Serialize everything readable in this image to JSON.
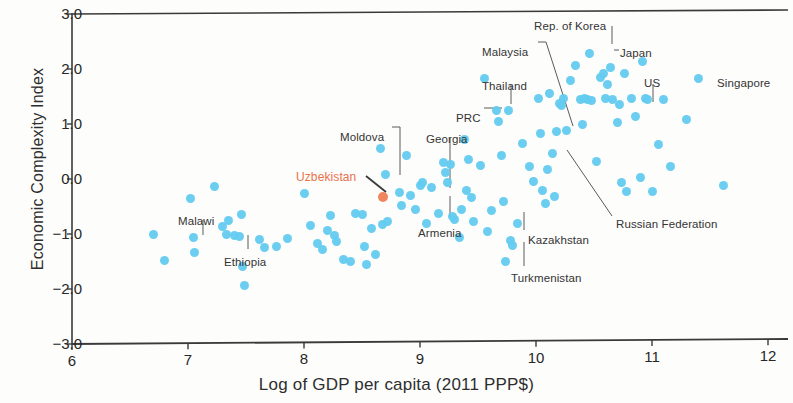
{
  "chart_data": {
    "type": "scatter",
    "title": "",
    "xlabel": "Log of GDP per capita (2011 PPP$)",
    "ylabel": "Economic Complexity Index",
    "xlim": [
      6,
      12
    ],
    "ylim": [
      -3.0,
      3.0
    ],
    "xticks": [
      "6",
      "7",
      "8",
      "9",
      "10",
      "11",
      "12"
    ],
    "yticks": [
      "3.0",
      "2.0",
      "1.0",
      "0.0",
      "-1.0",
      "-2.0",
      "-3.0"
    ],
    "grid": false,
    "legend": "none",
    "colors": {
      "point": "#63cbef",
      "highlight": "#ef8055",
      "axis": "#3a3a3a",
      "text": "#2e2e2e"
    },
    "series": [
      {
        "name": "Countries",
        "color": "#63cbef",
        "points": [
          [
            6.7,
            -1.0
          ],
          [
            6.8,
            -1.49
          ],
          [
            7.02,
            -0.35
          ],
          [
            7.05,
            -1.07
          ],
          [
            7.06,
            -1.33
          ],
          [
            7.23,
            -0.13
          ],
          [
            7.3,
            -0.87
          ],
          [
            7.33,
            -1.0
          ],
          [
            7.35,
            -0.75
          ],
          [
            7.4,
            -1.03
          ],
          [
            7.44,
            -1.05
          ],
          [
            7.46,
            -0.64
          ],
          [
            7.47,
            -1.59
          ],
          [
            7.49,
            -1.93
          ],
          [
            7.62,
            -1.1
          ],
          [
            7.66,
            -1.25
          ],
          [
            7.76,
            -1.22
          ],
          [
            7.86,
            -1.08
          ],
          [
            8.0,
            -0.27
          ],
          [
            8.06,
            -0.85
          ],
          [
            8.12,
            -1.17
          ],
          [
            8.16,
            -1.28
          ],
          [
            8.2,
            -0.93
          ],
          [
            8.23,
            -0.66
          ],
          [
            8.26,
            -1.03
          ],
          [
            8.28,
            -1.13
          ],
          [
            8.34,
            -1.46
          ],
          [
            8.4,
            -1.5
          ],
          [
            8.44,
            -0.63
          ],
          [
            8.5,
            -0.65
          ],
          [
            8.52,
            -1.22
          ],
          [
            8.54,
            -1.55
          ],
          [
            8.58,
            -0.9
          ],
          [
            8.62,
            -1.38
          ],
          [
            8.68,
            -0.82
          ],
          [
            8.72,
            -0.78
          ],
          [
            8.7,
            0.08
          ],
          [
            8.66,
            0.56
          ],
          [
            8.82,
            -0.25
          ],
          [
            8.84,
            -0.48
          ],
          [
            8.88,
            0.43
          ],
          [
            8.92,
            -0.3
          ],
          [
            8.96,
            -0.56
          ],
          [
            9.0,
            -0.12
          ],
          [
            9.02,
            -0.06
          ],
          [
            9.06,
            -0.8
          ],
          [
            9.1,
            -0.16
          ],
          [
            9.16,
            -0.63
          ],
          [
            9.2,
            0.3
          ],
          [
            9.22,
            0.12
          ],
          [
            9.24,
            -0.07
          ],
          [
            9.26,
            0.26
          ],
          [
            9.28,
            -0.68
          ],
          [
            9.3,
            -0.73
          ],
          [
            9.34,
            -1.07
          ],
          [
            9.36,
            -0.55
          ],
          [
            9.38,
            0.72
          ],
          [
            9.4,
            -0.2
          ],
          [
            9.42,
            0.36
          ],
          [
            9.44,
            -0.34
          ],
          [
            9.46,
            -0.77
          ],
          [
            9.52,
            0.25
          ],
          [
            9.56,
            1.82
          ],
          [
            9.58,
            -0.95
          ],
          [
            9.62,
            -0.58
          ],
          [
            9.66,
            1.24
          ],
          [
            9.68,
            1.04
          ],
          [
            9.7,
            0.42
          ],
          [
            9.72,
            -0.4
          ],
          [
            9.74,
            -1.5
          ],
          [
            9.76,
            1.25
          ],
          [
            9.78,
            -1.12
          ],
          [
            9.8,
            -1.2
          ],
          [
            9.84,
            -0.8
          ],
          [
            9.88,
            0.64
          ],
          [
            9.94,
            0.22
          ],
          [
            9.98,
            -0.05
          ],
          [
            10.02,
            1.46
          ],
          [
            10.04,
            0.82
          ],
          [
            10.06,
            -0.2
          ],
          [
            10.08,
            -0.45
          ],
          [
            10.1,
            0.18
          ],
          [
            10.12,
            1.55
          ],
          [
            10.14,
            0.46
          ],
          [
            10.16,
            -0.32
          ],
          [
            10.18,
            0.86
          ],
          [
            10.2,
            1.38
          ],
          [
            10.22,
            1.34
          ],
          [
            10.24,
            1.46
          ],
          [
            10.26,
            0.88
          ],
          [
            10.3,
            1.8
          ],
          [
            10.34,
            2.06
          ],
          [
            10.38,
            1.44
          ],
          [
            10.4,
            1.0
          ],
          [
            10.42,
            1.46
          ],
          [
            10.44,
            1.44
          ],
          [
            10.46,
            2.28
          ],
          [
            10.48,
            1.42
          ],
          [
            10.52,
            0.32
          ],
          [
            10.56,
            1.84
          ],
          [
            10.58,
            1.92
          ],
          [
            10.6,
            1.46
          ],
          [
            10.62,
            1.72
          ],
          [
            10.64,
            2.02
          ],
          [
            10.66,
            1.44
          ],
          [
            10.7,
            1.02
          ],
          [
            10.72,
            1.36
          ],
          [
            10.74,
            -0.06
          ],
          [
            10.76,
            1.92
          ],
          [
            10.78,
            -0.22
          ],
          [
            10.82,
            1.46
          ],
          [
            10.86,
            1.14
          ],
          [
            10.9,
            0.02
          ],
          [
            10.92,
            2.14
          ],
          [
            10.94,
            1.46
          ],
          [
            10.96,
            1.44
          ],
          [
            11.0,
            -0.22
          ],
          [
            11.06,
            0.62
          ],
          [
            11.1,
            1.44
          ],
          [
            11.16,
            0.22
          ],
          [
            11.3,
            1.08
          ],
          [
            11.4,
            1.82
          ],
          [
            11.62,
            -0.12
          ]
        ]
      },
      {
        "name": "Uzbekistan",
        "color": "#ef8055",
        "highlight": true,
        "points": [
          [
            8.68,
            -0.33
          ]
        ]
      }
    ],
    "annotations": [
      {
        "label": "Malawi",
        "text_x": 178,
        "text_y": 215,
        "anchor": "middle",
        "line": [
          [
            203,
            220
          ],
          [
            203,
            235
          ]
        ],
        "highlight": false
      },
      {
        "label": "Ethiopia",
        "text_x": 224,
        "text_y": 256,
        "anchor": "middle",
        "line": [
          [
            248,
            235
          ],
          [
            248,
            249
          ]
        ],
        "highlight": false
      },
      {
        "label": "Moldova",
        "text_x": 340,
        "text_y": 131,
        "anchor": "start",
        "line": [
          [
            392,
            127
          ],
          [
            400,
            127
          ],
          [
            400,
            175
          ]
        ],
        "highlight": false
      },
      {
        "label": "Uzbekistan",
        "text_x": 296,
        "text_y": 170,
        "anchor": "start",
        "line": [
          [
            366,
            176
          ],
          [
            386,
            192
          ]
        ],
        "highlight": true
      },
      {
        "label": "Georgia",
        "text_x": 426,
        "text_y": 133,
        "anchor": "start",
        "line": [
          [
            450,
            138
          ],
          [
            450,
            188
          ]
        ],
        "highlight": false
      },
      {
        "label": "Armenia",
        "text_x": 418,
        "text_y": 227,
        "anchor": "start",
        "line": [
          [
            450,
            196
          ],
          [
            450,
            217
          ]
        ],
        "highlight": false
      },
      {
        "label": "PRC",
        "text_x": 456,
        "text_y": 112,
        "anchor": "start",
        "line": [
          [
            484,
            108
          ],
          [
            502,
            108
          ]
        ],
        "highlight": false
      },
      {
        "label": "Thailand",
        "text_x": 482,
        "text_y": 80,
        "anchor": "start",
        "line": [
          [
            511,
            85
          ],
          [
            511,
            104
          ]
        ],
        "highlight": false
      },
      {
        "label": "Malaysia",
        "text_x": 482,
        "text_y": 46,
        "anchor": "start",
        "line": [
          [
            538,
            42
          ],
          [
            546,
            42
          ],
          [
            573,
            126
          ]
        ],
        "highlight": false
      },
      {
        "label": "Rep. of Korea",
        "text_x": 534,
        "text_y": 20,
        "anchor": "start",
        "line": [
          [
            612,
            26
          ],
          [
            612,
            44
          ]
        ],
        "highlight": false
      },
      {
        "label": "Japan",
        "text_x": 620,
        "text_y": 47,
        "anchor": "start",
        "line": [
          [
            614,
            50
          ],
          [
            619,
            50
          ]
        ],
        "highlight": false
      },
      {
        "label": "US",
        "text_x": 644,
        "text_y": 77,
        "anchor": "start",
        "line": [
          [
            653,
            84
          ],
          [
            653,
            102
          ]
        ],
        "highlight": false
      },
      {
        "label": "Singapore",
        "text_x": 717,
        "text_y": 77,
        "anchor": "start",
        "line": [],
        "highlight": false
      },
      {
        "label": "Kazakhstan",
        "text_x": 528,
        "text_y": 234,
        "anchor": "start",
        "line": [
          [
            524,
            212
          ],
          [
            524,
            230
          ]
        ],
        "highlight": false
      },
      {
        "label": "Turkmenistan",
        "text_x": 511,
        "text_y": 272,
        "anchor": "start",
        "line": [
          [
            524,
            242
          ],
          [
            524,
            266
          ]
        ],
        "highlight": false
      },
      {
        "label": "Russian Federation",
        "text_x": 616,
        "text_y": 218,
        "anchor": "start",
        "line": [
          [
            567,
            150
          ],
          [
            612,
            216
          ]
        ],
        "highlight": false
      }
    ]
  }
}
